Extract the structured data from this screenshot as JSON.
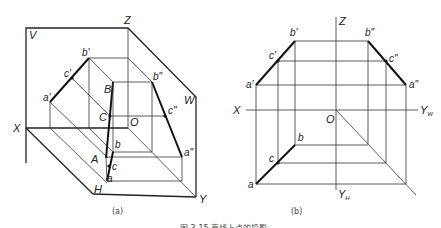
{
  "figure_a": {
    "caption": "(a)",
    "labels": {
      "V": "V",
      "Z": "Z",
      "W": "W",
      "X": "X",
      "Y": "Y",
      "H": "H",
      "O": "O",
      "A": "A",
      "B": "B",
      "C": "C",
      "a": "a",
      "b": "b",
      "c": "c",
      "a1": "a'",
      "b1": "b'",
      "c1": "c'",
      "a2": "a\"",
      "b2": "b\"",
      "c2": "c\""
    }
  },
  "figure_b": {
    "caption": "(b)",
    "labels": {
      "Z": "Z",
      "X": "X",
      "O": "O",
      "YW": "Y",
      "YW_sub": "W",
      "YH": "Y",
      "YH_sub": "H",
      "a": "a",
      "b": "b",
      "c": "c",
      "a1": "a'",
      "b1": "b'",
      "c1": "c'",
      "a2": "a\"",
      "b2": "b\"",
      "c2": "c\""
    }
  },
  "figure_caption": "图 3-15  直线上点的投影"
}
